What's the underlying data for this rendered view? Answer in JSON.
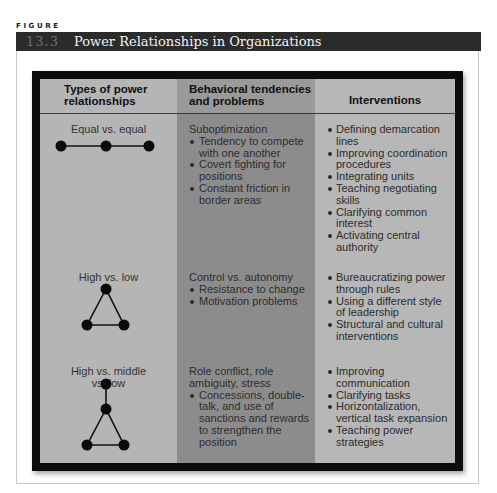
{
  "figure": {
    "label": "FIGURE",
    "number": "13.3",
    "title": "Power Relationships in Organizations"
  },
  "table": {
    "headers": {
      "col1": "Types of power relationships",
      "col2": "Behavioral tendencies and problems",
      "col3": "Interventions"
    },
    "rows": [
      {
        "type": "Equal vs. equal",
        "diagram": "three-nodes-in-line-icon",
        "tendency_title": "Suboptimization",
        "tendencies": [
          "Tendency to compete with one another",
          "Covert fighting for positions",
          "Constant friction in border areas"
        ],
        "interventions": [
          "Defining demarcation lines",
          "Improving coordination procedures",
          "Integrating units",
          "Teaching negotiating skills",
          "Clarifying common interest",
          "Activating central authority"
        ]
      },
      {
        "type": "High vs. low",
        "diagram": "triangle-nodes-icon",
        "tendency_title": "Control vs. autonomy",
        "tendencies": [
          "Resistance to change",
          "Motivation problems"
        ],
        "interventions": [
          "Bureaucratizing power through rules",
          "Using a different style of leadership",
          "Structural and cultural interventions"
        ]
      },
      {
        "type": "High vs. middle vs. low",
        "diagram": "hierarchy-triangle-nodes-icon",
        "tendency_title": "Role conflict, role ambiguity, stress",
        "tendencies": [
          "Concessions, double-talk, and use of sanctions and rewards to strengthen the position"
        ],
        "interventions": [
          "Improving communication",
          "Clarifying tasks",
          "Horizontalization, vertical task expansion",
          "Teaching power strategies"
        ]
      }
    ]
  },
  "colors": {
    "title_bar": "#2b2b2b",
    "frame": "#0c0c0c",
    "col_light": "#b5b5b5",
    "col_dark": "#8c8c8c"
  }
}
